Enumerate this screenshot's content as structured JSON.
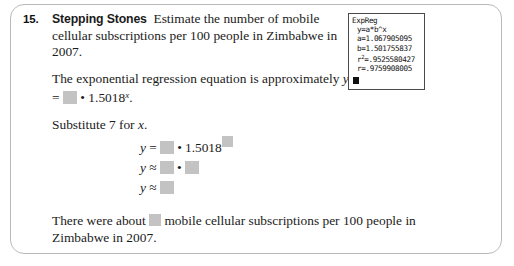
{
  "exercise": {
    "number": "15.",
    "lead_in": "Stepping Stones",
    "prompt": "Estimate the number of mobile cellular subscriptions per 100 people in Zimbabwe in 2007.",
    "regression_intro": "The exponential regression equation is approximately",
    "regression_y_label": "y",
    "regression_equals": "=",
    "regression_dot": "•",
    "regression_base": "1.5018",
    "regression_exponent": "x",
    "regression_period": ".",
    "substitute_text": "Substitute 7 for x.",
    "substitute_prefix": "Substitute 7 for ",
    "substitute_var": "x",
    "substitute_suffix": ".",
    "equations": [
      {
        "var": "y",
        "relation": "=",
        "operator": "•",
        "coefficient_blank": true,
        "base": "1.5018",
        "exponent_blank": true
      },
      {
        "var": "y",
        "relation": "≈",
        "operator": "•",
        "left_blank": true,
        "right_blank": true
      },
      {
        "var": "y",
        "relation": "≈",
        "result_blank": true
      }
    ],
    "conclusion_prefix": "There were about",
    "conclusion_suffix": "mobile cellular subscriptions per 100 people in Zimbabwe in 2007."
  },
  "calculator": {
    "title": "ExpReg",
    "model_line": "y=a*b^x",
    "a_label": "a=",
    "a_value": "1.067905095",
    "b_label": "b=",
    "b_value": "1.501755837",
    "r2_label": "r",
    "r2_sup": "2",
    "r2_equals": "=",
    "r2_value": ".9525580427",
    "r_label": "r=",
    "r_value": ".9759908005",
    "cursor": "■"
  },
  "colors": {
    "blank_fill": "#c3c3c3",
    "frame_border": "#b9b9b9",
    "calc_border": "#4a4a4a",
    "text": "#1b1b1b"
  }
}
